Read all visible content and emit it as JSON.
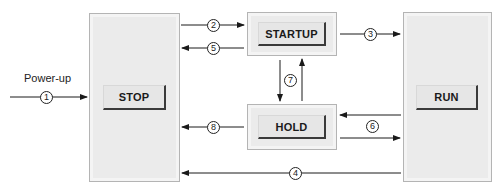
{
  "diagram": {
    "type": "state-transition",
    "states": {
      "stop": {
        "label": "STOP"
      },
      "startup": {
        "label": "STARTUP"
      },
      "hold": {
        "label": "HOLD"
      },
      "run": {
        "label": "RUN"
      }
    },
    "entry": {
      "label": "Power-up",
      "number": "1"
    },
    "transitions": [
      {
        "number": "1",
        "from": "Power-up",
        "to": "STOP"
      },
      {
        "number": "2",
        "from": "STOP",
        "to": "STARTUP"
      },
      {
        "number": "3",
        "from": "STARTUP",
        "to": "RUN"
      },
      {
        "number": "4",
        "from": "RUN",
        "to": "STOP"
      },
      {
        "number": "5",
        "from": "STARTUP",
        "to": "STOP"
      },
      {
        "number": "6",
        "from": "RUN",
        "to": "HOLD",
        "bidirectional": true
      },
      {
        "number": "7",
        "from": "STARTUP",
        "to": "HOLD",
        "bidirectional": true
      },
      {
        "number": "8",
        "from": "HOLD",
        "to": "STOP"
      }
    ],
    "colors": {
      "box_fill": "#ebebeb",
      "box_border": "#b4b4b4",
      "button_fill": "#e6e6e6",
      "line": "#1a1a1a"
    }
  }
}
